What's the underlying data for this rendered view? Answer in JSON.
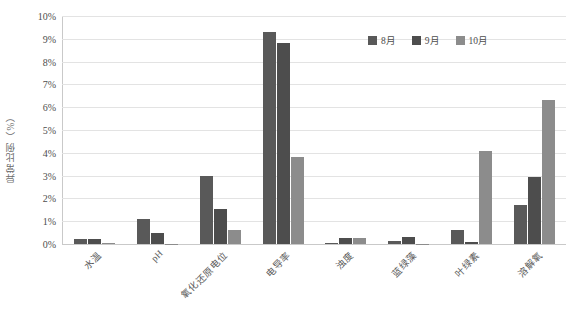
{
  "chart_data": {
    "type": "bar",
    "title": "",
    "subtitle": "",
    "xlabel": "",
    "ylabel": "异常比例（%）",
    "ylim": [
      0,
      10
    ],
    "ytick_step": 1,
    "ytick_labels": [
      "10%",
      "9%",
      "8%",
      "7%",
      "6%",
      "5%",
      "4%",
      "3%",
      "2%",
      "1%",
      "0%"
    ],
    "grid": true,
    "legend_position": "top-right",
    "categories": [
      "水温",
      "pH",
      "氧化还原电位",
      "电导率",
      "浊度",
      "蓝绿藻",
      "叶绿素",
      "溶解氧"
    ],
    "series": [
      {
        "name": "8月",
        "color": "#595959",
        "values": [
          0.2,
          1.1,
          2.98,
          9.3,
          0.05,
          0.15,
          0.6,
          1.7
        ]
      },
      {
        "name": "9月",
        "color": "#4d4d4d",
        "values": [
          0.2,
          0.5,
          1.55,
          8.8,
          0.25,
          0.3,
          0.1,
          2.95
        ]
      },
      {
        "name": "10月",
        "color": "#8c8c8c",
        "values": [
          0.05,
          0.02,
          0.6,
          3.8,
          0.25,
          0.02,
          4.1,
          6.3
        ]
      }
    ]
  }
}
